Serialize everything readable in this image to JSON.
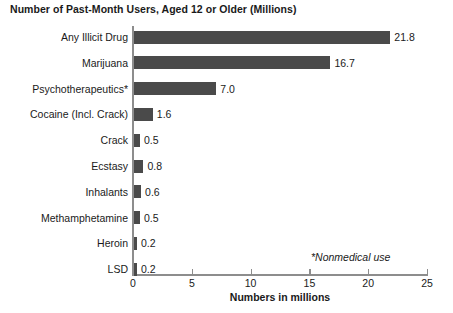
{
  "chart_data": {
    "type": "bar",
    "orientation": "horizontal",
    "title": "Number of Past-Month Users, Aged 12 or Older (Millions)",
    "xlabel": "Numbers in millions",
    "ylabel": "",
    "xlim": [
      0,
      25
    ],
    "xticks": [
      0,
      5,
      10,
      15,
      20,
      25
    ],
    "xtick_labels": [
      "0",
      "5",
      "10",
      "15",
      "20",
      "25"
    ],
    "grid": false,
    "legend": null,
    "annotation": "*Nonmedical use",
    "bar_color": "#4a4a4a",
    "axis_color": "#8d8d8d",
    "categories": [
      "Any Illicit Drug",
      "Marijuana",
      "Psychotherapeutics*",
      "Cocaine (Incl. Crack)",
      "Crack",
      "Ecstasy",
      "Inhalants",
      "Methamphetamine",
      "Heroin",
      "LSD"
    ],
    "values": [
      21.8,
      16.7,
      7.0,
      1.6,
      0.5,
      0.8,
      0.6,
      0.5,
      0.2,
      0.2
    ],
    "value_labels": [
      "21.8",
      "16.7",
      "7.0",
      "1.6",
      "0.5",
      "0.8",
      "0.6",
      "0.5",
      "0.2",
      "0.2"
    ]
  }
}
